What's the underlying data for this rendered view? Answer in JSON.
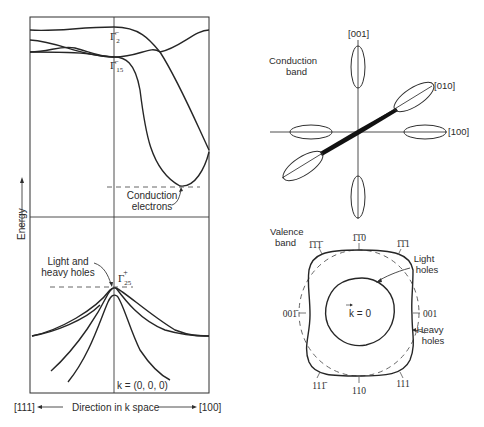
{
  "left_panel": {
    "axis_label": "Energy",
    "bands": {
      "gamma2_label": "Γ",
      "gamma2_sub": "2",
      "gamma2_sup": "−",
      "gamma15_label": "Γ",
      "gamma15_sub": "15",
      "gamma15_sup": "−",
      "gamma25_label": "Γ",
      "gamma25_sub": "25",
      "gamma25_sup": "+"
    },
    "annotations": {
      "conduction_line1": "Conduction",
      "conduction_line2": "electrons",
      "holes_line1": "Light and",
      "holes_line2": "heavy holes",
      "k_origin": "k = (0, 0, 0)"
    },
    "x_axis": {
      "left_direction": "[111]",
      "center_label": "Direction in k space",
      "right_direction": "[100]"
    }
  },
  "right_panel": {
    "conduction_band": {
      "title_line1": "Conduction",
      "title_line2": "band",
      "axes": {
        "z": "[001]",
        "y": "[010]",
        "x": "[100]"
      }
    },
    "valence_band": {
      "title_line1": "Valence",
      "title_line2": "band",
      "center_label": "k = 0",
      "light_holes_line1": "Light",
      "light_holes_line2": "holes",
      "heavy_holes_line1": "Heavy",
      "heavy_holes_line2": "holes",
      "directions": {
        "top": "1̄1̄0",
        "top_left": "1̄1̄1̄",
        "top_right": "1̄1̄1",
        "left": "001̄",
        "right": "001",
        "bottom_left": "111̄",
        "bottom": "110",
        "bottom_right": "111"
      }
    }
  },
  "colors": {
    "ink": "#2b2b2b",
    "background": "#ffffff"
  }
}
